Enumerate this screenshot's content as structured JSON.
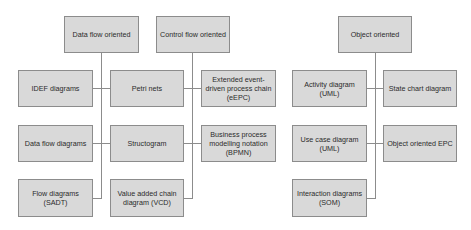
{
  "diagram": {
    "colors": {
      "box_fill": "#d9d9d9",
      "box_border": "#8c8c8c",
      "text": "#2b2b2b",
      "connector": "#8c8c8c"
    },
    "categories": [
      {
        "label": "Data flow oriented",
        "items": [
          "IDEF diagrams",
          "Data flow diagrams",
          "Flow diagrams (SADT)"
        ]
      },
      {
        "label": "Control flow oriented",
        "items": [
          "Petri nets",
          "Structogram",
          "Value added chain diagram (VCD)"
        ],
        "right_items": [
          "Extended event-driven process chain (eEPC)",
          "Business process modelling notation (BPMN)"
        ]
      },
      {
        "label": "Object oriented",
        "items": [
          "Activity diagram (UML)",
          "Use case diagram (UML)",
          "Interaction diagrams (SOM)"
        ],
        "right_items": [
          "State chart diagram",
          "Object oriented EPC"
        ]
      }
    ]
  }
}
